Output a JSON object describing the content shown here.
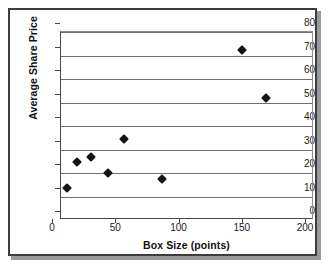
{
  "chart_data": {
    "type": "scatter",
    "title": "",
    "xlabel": "Box Size (points)",
    "ylabel": "Average Share Price",
    "xlim": [
      0,
      200
    ],
    "ylim": [
      0,
      80
    ],
    "xticks": [
      0,
      50,
      100,
      150,
      200
    ],
    "yticks": [
      0,
      10,
      20,
      30,
      40,
      50,
      60,
      70,
      80
    ],
    "xtick_labels": [
      "0",
      "50",
      "100",
      "150",
      "200"
    ],
    "ytick_labels": [
      "0",
      "10",
      "20",
      "30",
      "40",
      "50",
      "60",
      "70",
      "80"
    ],
    "grid": "horizontal",
    "legend": "none",
    "marker": "diamond",
    "marker_color": "#151515",
    "series": [
      {
        "name": "Average Share Price vs Box Size",
        "points": [
          {
            "x": 5,
            "y": 13.5
          },
          {
            "x": 13,
            "y": 24.8
          },
          {
            "x": 24,
            "y": 26.8
          },
          {
            "x": 37,
            "y": 20.0
          },
          {
            "x": 50,
            "y": 34.3
          },
          {
            "x": 80,
            "y": 17.5
          },
          {
            "x": 143,
            "y": 72.3
          },
          {
            "x": 162,
            "y": 52.0
          }
        ]
      }
    ]
  },
  "colors": {
    "marker": "#151515",
    "gridline": "#6e6e6e",
    "axis": "#4a4a4a",
    "frame": "#3d3d3d",
    "background": "#ffffff",
    "text": "#111111"
  }
}
